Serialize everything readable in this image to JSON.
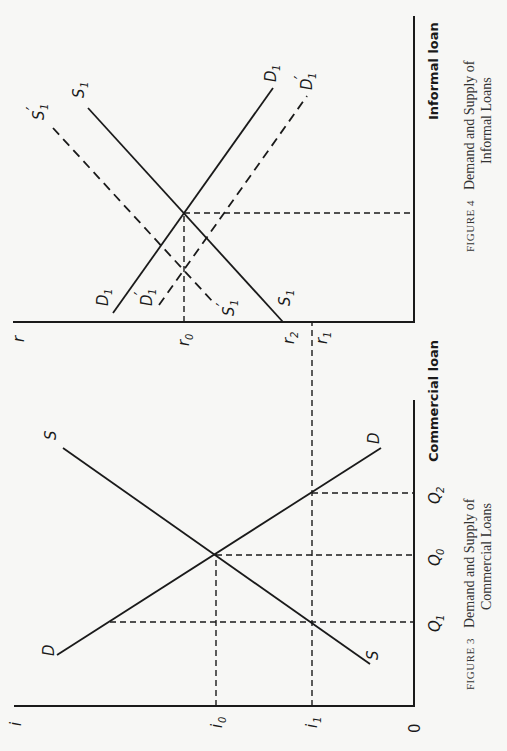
{
  "figure3": {
    "caption_prefix": "FIGURE 3",
    "caption_line1": "Demand and Supply of",
    "caption_line2": "Commercial Loans",
    "y_axis_label": "i",
    "x_axis_label": "Commercial loan",
    "origin_label": "0",
    "y_ticks": [
      {
        "main": "i",
        "sub": "0",
        "name": "i0"
      },
      {
        "main": "i",
        "sub": "1",
        "name": "i1"
      }
    ],
    "x_ticks": [
      {
        "main": "Q",
        "sub": "1",
        "name": "Q1"
      },
      {
        "main": "Q",
        "sub": "0",
        "name": "Q0"
      },
      {
        "main": "Q",
        "sub": "2",
        "name": "Q2"
      }
    ],
    "curves": {
      "supply": "S",
      "demand": "D"
    }
  },
  "figure4": {
    "caption_prefix": "FIGURE 4",
    "caption_line1": "Demand and Supply of",
    "caption_line2": "Informal Loans",
    "y_axis_label": "r",
    "x_axis_label": "Informal loan",
    "y_ticks": [
      {
        "main": "r",
        "sub": "0",
        "name": "r0"
      },
      {
        "main": "r",
        "sub": "2",
        "name": "r2"
      },
      {
        "main": "r",
        "sub": "1",
        "name": "r1"
      }
    ],
    "curves": {
      "supply": {
        "main": "S",
        "sub": "1"
      },
      "demand": {
        "main": "D",
        "sub": "1"
      },
      "supply_shifted": {
        "main": "S",
        "sub": "1",
        "prime": "′"
      },
      "demand_shifted": {
        "main": "D",
        "sub": "1",
        "prime": "′"
      }
    }
  },
  "colors": {
    "ink": "#1a1a1a",
    "paper": "#f7f7f5",
    "caption": "#333333"
  }
}
